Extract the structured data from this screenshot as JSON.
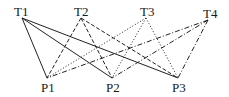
{
  "diagram": {
    "type": "bipartite-graph",
    "top_nodes": [
      {
        "id": "T1",
        "label": "T1",
        "x": 22,
        "y": 18,
        "lx": 14,
        "ly": 16,
        "style": "solid"
      },
      {
        "id": "T2",
        "label": "T2",
        "x": 81,
        "y": 18,
        "lx": 74,
        "ly": 16,
        "style": "dashed"
      },
      {
        "id": "T3",
        "label": "T3",
        "x": 146,
        "y": 18,
        "lx": 140,
        "ly": 16,
        "style": "dotted"
      },
      {
        "id": "T4",
        "label": "T4",
        "x": 208,
        "y": 20,
        "lx": 203,
        "ly": 18,
        "style": "dash-dot"
      }
    ],
    "bottom_nodes": [
      {
        "id": "P1",
        "label": "P1",
        "x": 47,
        "y": 78,
        "lx": 41,
        "ly": 92
      },
      {
        "id": "P2",
        "label": "P2",
        "x": 112,
        "y": 78,
        "lx": 106,
        "ly": 92
      },
      {
        "id": "P3",
        "label": "P3",
        "x": 178,
        "y": 78,
        "lx": 172,
        "ly": 92
      }
    ],
    "edges": [
      {
        "from": "T1",
        "to": "P1"
      },
      {
        "from": "T1",
        "to": "P2"
      },
      {
        "from": "T1",
        "to": "P3"
      },
      {
        "from": "T2",
        "to": "P1"
      },
      {
        "from": "T2",
        "to": "P2"
      },
      {
        "from": "T2",
        "to": "P3"
      },
      {
        "from": "T3",
        "to": "P1"
      },
      {
        "from": "T3",
        "to": "P2"
      },
      {
        "from": "T3",
        "to": "P3"
      },
      {
        "from": "T4",
        "to": "P1"
      },
      {
        "from": "T4",
        "to": "P2"
      },
      {
        "from": "T4",
        "to": "P3"
      }
    ],
    "line_styles": {
      "solid": "",
      "dashed": "4,2",
      "dotted": "1,2",
      "dash-dot": "5,2,1,2"
    },
    "colors": {
      "line": "#222222",
      "text": "#1a1a1a",
      "background": "#ffffff"
    }
  }
}
